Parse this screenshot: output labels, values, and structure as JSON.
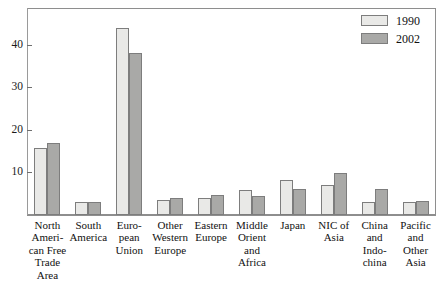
{
  "chart_data": {
    "type": "bar",
    "title": "",
    "subtitle": "",
    "xlabel": "",
    "ylabel": "",
    "ylim": [
      0,
      47
    ],
    "yticks": [
      10,
      20,
      30,
      40
    ],
    "grid": false,
    "legend_position": "top-right",
    "categories": [
      "North American Free Trade Area",
      "South America",
      "European Union",
      "Other Western Europe",
      "Eastern Europe",
      "Middle Orient and Africa",
      "Japan",
      "NIC of Asia",
      "China and Indochina",
      "Pacific and Other Asia"
    ],
    "category_lines": [
      [
        "North",
        "Ameri-",
        "can Free",
        "Trade",
        "Area"
      ],
      [
        "South",
        "America"
      ],
      [
        "Euro-",
        "pean",
        "Union"
      ],
      [
        "Other",
        "Western",
        "Europe"
      ],
      [
        "Eastern",
        "Europe"
      ],
      [
        "Middle",
        "Orient",
        "and",
        "Africa"
      ],
      [
        "Japan"
      ],
      [
        "NIC of",
        "Asia"
      ],
      [
        "China",
        "and",
        "Indo-",
        "china"
      ],
      [
        "Pacific",
        "and",
        "Other",
        "Asia"
      ]
    ],
    "series": [
      {
        "name": "1990",
        "color": "#e9e9e7",
        "values": [
          15.8,
          3.0,
          44.0,
          3.6,
          4.0,
          5.8,
          8.3,
          7.0,
          3.0,
          3.0
        ]
      },
      {
        "name": "2002",
        "color": "#a9a9a7",
        "values": [
          17.0,
          3.0,
          38.0,
          4.0,
          4.8,
          4.4,
          6.0,
          9.8,
          6.0,
          3.4
        ]
      }
    ]
  },
  "legend": {
    "items": [
      {
        "label": "1990",
        "color": "#e9e9e7"
      },
      {
        "label": "2002",
        "color": "#a9a9a7"
      }
    ]
  },
  "axis": {
    "y_tick_labels": [
      "40",
      "30",
      "20",
      "10"
    ]
  }
}
